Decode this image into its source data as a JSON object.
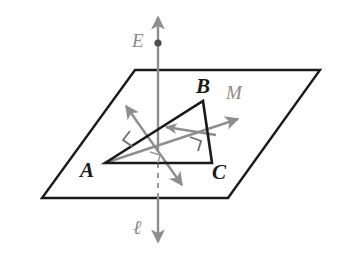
{
  "figure": {
    "type": "geometry-diagram",
    "colors": {
      "plane_outline": "#1a1a1a",
      "triangle_outline": "#1a1a1a",
      "line_l": "#8e8e8e",
      "arrow_m": "#8e8e8e",
      "perpendicular_arrow": "#8e8e8e",
      "label_black": "#1a1a1a",
      "label_gray": "#8a8a8a",
      "background": "#ffffff"
    },
    "labels": {
      "vertex_a": "A",
      "vertex_b": "B",
      "vertex_c": "C",
      "point_e": "E",
      "line_m": "M",
      "line_l": "ℓ"
    },
    "elements": {
      "plane": "parallelogram",
      "triangle": "ABC",
      "vertical_line": "line l through E, passing through plane",
      "point_dot": "E",
      "ray_m": "arrow M from A through plane",
      "perpendicular_marks": 3
    },
    "geometry": {
      "plane_corners": [
        [
          135,
          70
        ],
        [
          320,
          70
        ],
        [
          228,
          198
        ],
        [
          42,
          198
        ]
      ],
      "triangle_vertices": {
        "A": [
          105,
          163
        ],
        "B": [
          203,
          101
        ],
        "C": [
          212,
          163
        ]
      },
      "line_l_top": [
        158,
        16
      ],
      "line_l_bottom": [
        158,
        243
      ],
      "point_e": [
        158,
        43
      ],
      "ray_m_start": [
        105,
        163
      ],
      "ray_m_end": [
        242,
        118
      ],
      "arrow_inner_start": [
        215,
        134
      ],
      "arrow_inner_end": [
        163,
        126
      ],
      "diagonal_arrow_a": [
        124,
        104
      ],
      "diagonal_arrow_b": [
        184,
        187
      ]
    }
  }
}
